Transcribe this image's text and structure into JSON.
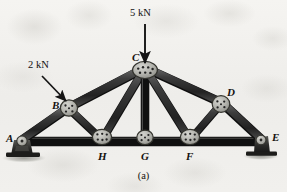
{
  "figure": {
    "caption": "(a)",
    "type": "truss-diagram"
  },
  "colors": {
    "member": "#3a3a3a",
    "member_dark": "#1c1c1c",
    "member_light": "#6e6e6e",
    "gusset": "#b9b9b4",
    "gusset_edge": "#3d3d3a",
    "rivet": "#232323",
    "support": "#2a2a28",
    "shadow": "#9a9a94",
    "background": "#f2f1ee",
    "text": "#15120f",
    "arrow": "#141414"
  },
  "joints": [
    {
      "id": "A",
      "label": "A",
      "x": 22,
      "y": 140,
      "label_x": 6,
      "label_y": 134,
      "support": "pin"
    },
    {
      "id": "B",
      "label": "B",
      "x": 68,
      "y": 108,
      "label_x": 52,
      "label_y": 101,
      "support": "none"
    },
    {
      "id": "C",
      "label": "C",
      "x": 145,
      "y": 68,
      "label_x": 132,
      "label_y": 53,
      "support": "none"
    },
    {
      "id": "D",
      "label": "D",
      "x": 222,
      "y": 103,
      "label_x": 228,
      "label_y": 88,
      "support": "none"
    },
    {
      "id": "E",
      "label": "E",
      "x": 262,
      "y": 140,
      "label_x": 272,
      "label_y": 133,
      "support": "roller"
    },
    {
      "id": "F",
      "label": "F",
      "x": 190,
      "y": 140,
      "label_x": 186,
      "label_y": 152,
      "support": "none"
    },
    {
      "id": "G",
      "label": "G",
      "x": 145,
      "y": 140,
      "label_x": 141,
      "label_y": 152,
      "support": "none"
    },
    {
      "id": "H",
      "label": "H",
      "x": 102,
      "y": 140,
      "label_x": 98,
      "label_y": 152,
      "support": "none"
    }
  ],
  "members": [
    {
      "from": "A",
      "to": "B",
      "kind": "top-chord"
    },
    {
      "from": "B",
      "to": "C",
      "kind": "top-chord"
    },
    {
      "from": "C",
      "to": "D",
      "kind": "top-chord"
    },
    {
      "from": "D",
      "to": "E",
      "kind": "top-chord"
    },
    {
      "from": "A",
      "to": "H",
      "kind": "bottom-chord"
    },
    {
      "from": "H",
      "to": "G",
      "kind": "bottom-chord"
    },
    {
      "from": "G",
      "to": "F",
      "kind": "bottom-chord"
    },
    {
      "from": "F",
      "to": "E",
      "kind": "bottom-chord"
    },
    {
      "from": "B",
      "to": "H",
      "kind": "web"
    },
    {
      "from": "C",
      "to": "H",
      "kind": "web"
    },
    {
      "from": "C",
      "to": "G",
      "kind": "web-vertical"
    },
    {
      "from": "C",
      "to": "F",
      "kind": "web"
    },
    {
      "from": "D",
      "to": "F",
      "kind": "web"
    }
  ],
  "loads": [
    {
      "id": "load-5kn",
      "label": "5 kN",
      "magnitude": 5,
      "unit": "kN",
      "applied_at": "C",
      "direction": "down",
      "label_x": 130,
      "label_y": 8,
      "tail_x": 145,
      "tail_y": 24,
      "head_x": 145,
      "head_y": 64
    },
    {
      "id": "load-2kn",
      "label": "2 kN",
      "magnitude": 2,
      "unit": "kN",
      "applied_at": "B",
      "direction": "down-right",
      "label_x": 30,
      "label_y": 62,
      "tail_x": 42,
      "tail_y": 76,
      "head_x": 68,
      "head_y": 103
    }
  ],
  "supports": [
    {
      "at": "A",
      "type": "pin",
      "x": 22,
      "y": 140
    },
    {
      "at": "E",
      "type": "roller",
      "x": 262,
      "y": 140
    }
  ]
}
